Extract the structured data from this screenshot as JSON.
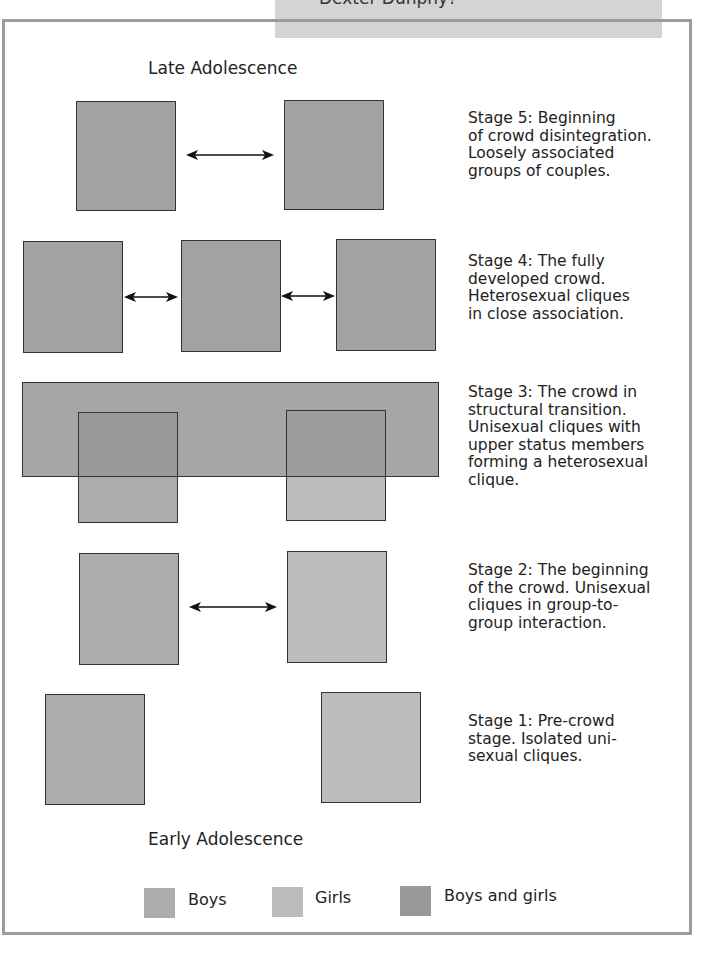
{
  "banner": {
    "text": "Dexter Dunphy?"
  },
  "diagram": {
    "top_label": "Late Adolescence",
    "bottom_label": "Early Adolescence",
    "colors": {
      "boys": "#acacac",
      "girls": "#bcbcbc",
      "both": "#a2a2a2",
      "frame": "#9c9c9c",
      "banner": "#d4d4d4"
    },
    "stages": [
      {
        "id": 5,
        "text": "Stage 5: Beginning of crowd disintegration. Loosely associated groups of couples.",
        "lines": [
          "Stage 5: Beginning",
          "of crowd disintegration.",
          "Loosely associated",
          "groups of couples."
        ]
      },
      {
        "id": 4,
        "text": "Stage 4: The fully developed crowd. Heterosexual cliques in close association.",
        "lines": [
          "Stage 4: The fully",
          "developed crowd.",
          "Heterosexual cliques",
          "in close association."
        ]
      },
      {
        "id": 3,
        "text": "Stage 3: The crowd in structural transition. Unisexual cliques with upper status members forming a heterosexual clique.",
        "lines": [
          "Stage 3: The crowd in",
          "structural transition.",
          "Unisexual cliques with",
          "upper status members",
          "forming a heterosexual",
          "clique."
        ]
      },
      {
        "id": 2,
        "text": "Stage 2: The beginning of the crowd. Unisexual cliques in group-to-group interaction.",
        "lines": [
          "Stage 2: The beginning",
          "of the crowd. Unisexual",
          "cliques in group-to-",
          "group interaction."
        ]
      },
      {
        "id": 1,
        "text": "Stage 1: Pre-crowd stage. Isolated unisexual cliques.",
        "lines": [
          "Stage 1: Pre-crowd",
          "stage. Isolated uni-",
          "sexual cliques."
        ]
      }
    ]
  },
  "legend": {
    "items": [
      {
        "label": "Boys",
        "color": "#acacac"
      },
      {
        "label": "Girls",
        "color": "#bcbcbc"
      },
      {
        "label": "Boys and girls",
        "color": "#a2a2a2"
      }
    ]
  }
}
